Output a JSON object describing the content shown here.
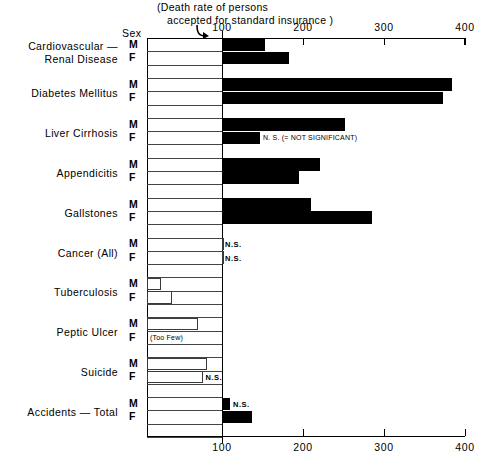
{
  "chart_data": {
    "type": "bar",
    "title": "",
    "caption_line1": "(Death rate of persons",
    "caption_line2": "accepted for standard insurance )",
    "xlabel": "",
    "ylabel": "",
    "sex_header": "Sex",
    "xlim": [
      0,
      400
    ],
    "baseline": 100,
    "grid": true,
    "legend_position": "none",
    "legend_note": "N. S. (= NOT SIGNIFICANT)",
    "tick_labels": [
      "100",
      "200",
      "300",
      "400"
    ],
    "tick_values": [
      100,
      200,
      300,
      400
    ],
    "categories": [
      "Cardiovascular — Renal Disease",
      "Diabetes Mellitus",
      "Liver Cirrhosis",
      "Appendicitis",
      "Gallstones",
      "Cancer (All)",
      "Tuberculosis",
      "Peptic Ulcer",
      "Suicide",
      "Accidents — Total"
    ],
    "series": [
      {
        "name": "M",
        "values": [
          153,
          384,
          252,
          221,
          210,
          100,
          25,
          70,
          82,
          110
        ]
      },
      {
        "name": "F",
        "values": [
          183,
          373,
          147,
          195,
          285,
          100,
          38,
          null,
          76,
          137
        ]
      }
    ],
    "groups": [
      {
        "label_line1": "Cardiovascular —",
        "label_line2": "Renal Disease",
        "bars": [
          {
            "sex": "M",
            "value": 153,
            "style": "filled",
            "note": ""
          },
          {
            "sex": "F",
            "value": 183,
            "style": "filled",
            "note": ""
          }
        ]
      },
      {
        "label_line1": "Diabetes Mellitus",
        "label_line2": "",
        "bars": [
          {
            "sex": "M",
            "value": 384,
            "style": "filled",
            "note": ""
          },
          {
            "sex": "F",
            "value": 373,
            "style": "filled",
            "note": ""
          }
        ]
      },
      {
        "label_line1": "Liver Cirrhosis",
        "label_line2": "",
        "bars": [
          {
            "sex": "M",
            "value": 252,
            "style": "filled",
            "note": ""
          },
          {
            "sex": "F",
            "value": 147,
            "style": "filled",
            "note": "N. S. (= NOT SIGNIFICANT)"
          }
        ]
      },
      {
        "label_line1": "Appendicitis",
        "label_line2": "",
        "bars": [
          {
            "sex": "M",
            "value": 221,
            "style": "filled",
            "note": ""
          },
          {
            "sex": "F",
            "value": 195,
            "style": "filled",
            "note": ""
          }
        ]
      },
      {
        "label_line1": "Gallstones",
        "label_line2": "",
        "bars": [
          {
            "sex": "M",
            "value": 210,
            "style": "filled",
            "note": ""
          },
          {
            "sex": "F",
            "value": 285,
            "style": "filled",
            "note": ""
          }
        ]
      },
      {
        "label_line1": "Cancer (All)",
        "label_line2": "",
        "bars": [
          {
            "sex": "M",
            "value": 100,
            "style": "hollow",
            "note": "N.S."
          },
          {
            "sex": "F",
            "value": 100,
            "style": "hollow",
            "note": "N.S."
          }
        ]
      },
      {
        "label_line1": "Tuberculosis",
        "label_line2": "",
        "bars": [
          {
            "sex": "M",
            "value": 25,
            "style": "hollow",
            "note": ""
          },
          {
            "sex": "F",
            "value": 38,
            "style": "hollow",
            "note": ""
          }
        ]
      },
      {
        "label_line1": "Peptic Ulcer",
        "label_line2": "",
        "bars": [
          {
            "sex": "M",
            "value": 70,
            "style": "hollow",
            "note": ""
          },
          {
            "sex": "F",
            "value": null,
            "style": "none",
            "note": "(Too Few)"
          }
        ]
      },
      {
        "label_line1": "Suicide",
        "label_line2": "",
        "bars": [
          {
            "sex": "M",
            "value": 82,
            "style": "hollow",
            "note": ""
          },
          {
            "sex": "F",
            "value": 76,
            "style": "hollow",
            "note": "N.S."
          }
        ]
      },
      {
        "label_line1": "Accidents — Total",
        "label_line2": "",
        "bars": [
          {
            "sex": "M",
            "value": 110,
            "style": "filled",
            "note": "N.S."
          },
          {
            "sex": "F",
            "value": 137,
            "style": "filled",
            "note": ""
          }
        ]
      }
    ]
  }
}
